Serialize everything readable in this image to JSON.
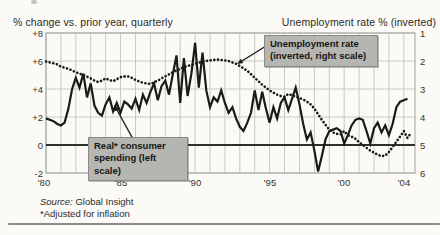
{
  "header": {
    "left_title": "% change vs. prior year, quarterly",
    "right_title": "Unemployment rate % (inverted)"
  },
  "annotations": {
    "unemployment_box": {
      "line1": "Unemployment rate",
      "line2": "(inverted, right scale)"
    },
    "spending_box": {
      "line1": "Real* consumer",
      "line2": "spending (left scale)"
    }
  },
  "footer": {
    "source_label": "Source:",
    "source_value": "Global Insight",
    "footnote": "*Adjusted for inflation"
  },
  "axes": {
    "left_ticks": [
      "+8",
      "+6",
      "+4",
      "+2",
      "0",
      "-2"
    ],
    "right_ticks": [
      "1",
      "2",
      "3",
      "4",
      "5",
      "6"
    ],
    "x_ticks": [
      "'80",
      "'85",
      "'90",
      "'95",
      "'00",
      "'04"
    ]
  },
  "colors": {
    "line": "#1a1a18",
    "grid": "#c9c9c3",
    "frame": "#a2a29c",
    "zero_line": "#2e2e2a",
    "box_bg": "#b5b5b1",
    "background": "#fbfaf7"
  },
  "chart_data": {
    "type": "line",
    "x_axis": {
      "range": [
        1980,
        2004.75
      ],
      "tick_years": [
        1980,
        1985,
        1990,
        1995,
        2000,
        2004
      ],
      "tick_labels": [
        "'80",
        "'85",
        "'90",
        "'95",
        "'00",
        "'04"
      ],
      "grid_step_years": 1
    },
    "left_axis": {
      "label": "% change vs. prior year, quarterly",
      "range": [
        -2,
        8
      ],
      "tick_values": [
        8,
        6,
        4,
        2,
        0,
        -2
      ],
      "zero_line_emphasized": true
    },
    "right_axis": {
      "label": "Unemployment rate % (inverted)",
      "range": [
        1,
        6
      ],
      "inverted": true,
      "tick_values": [
        1,
        2,
        3,
        4,
        5,
        6
      ]
    },
    "grid": true,
    "legend_position": "callout-boxes",
    "series": [
      {
        "name": "Unemployment rate (inverted, right scale)",
        "axis": "right",
        "style": "dotted",
        "x_start": 1980,
        "x_step": 0.25,
        "y": [
          2.02,
          2.05,
          2.08,
          2.12,
          2.2,
          2.24,
          2.28,
          2.34,
          2.4,
          2.45,
          2.5,
          2.56,
          2.62,
          2.7,
          2.75,
          2.7,
          2.62,
          2.68,
          2.72,
          2.65,
          2.58,
          2.55,
          2.55,
          2.6,
          2.68,
          2.73,
          2.78,
          2.8,
          2.82,
          2.76,
          2.7,
          2.62,
          2.55,
          2.48,
          2.4,
          2.34,
          2.28,
          2.22,
          2.18,
          2.14,
          2.1,
          2.06,
          2.02,
          2.0,
          1.98,
          1.96,
          1.95,
          1.96,
          1.98,
          2.0,
          2.05,
          2.1,
          2.18,
          2.26,
          2.35,
          2.47,
          2.6,
          2.72,
          2.85,
          2.95,
          3.05,
          3.13,
          3.2,
          3.25,
          3.28,
          3.18,
          3.22,
          3.28,
          3.32,
          3.38,
          3.45,
          3.55,
          3.7,
          3.9,
          4.1,
          4.28,
          4.45,
          4.55,
          4.6,
          4.62,
          4.5,
          4.65,
          4.7,
          4.78,
          4.9,
          5.0,
          5.1,
          5.2,
          5.28,
          5.35,
          5.4,
          5.38,
          5.25,
          5.08,
          4.88,
          4.7,
          4.5,
          4.75,
          4.55
        ]
      },
      {
        "name": "Real consumer spending (left scale)",
        "axis": "left",
        "style": "solid",
        "x_start": 1980,
        "x_step": 0.25,
        "y": [
          1.9,
          1.8,
          1.7,
          1.5,
          1.4,
          1.6,
          2.6,
          4.0,
          4.8,
          4.1,
          5.1,
          3.4,
          4.4,
          2.8,
          2.3,
          2.1,
          2.9,
          3.4,
          2.4,
          3.0,
          2.3,
          3.1,
          2.9,
          2.6,
          3.3,
          2.5,
          3.6,
          3.0,
          3.8,
          4.4,
          3.2,
          4.2,
          4.6,
          3.6,
          5.0,
          6.4,
          3.0,
          6.2,
          3.5,
          5.1,
          7.3,
          4.1,
          6.6,
          3.9,
          2.7,
          3.4,
          3.1,
          3.9,
          3.0,
          2.3,
          2.7,
          1.9,
          1.3,
          1.0,
          1.6,
          2.3,
          3.9,
          2.5,
          3.8,
          2.6,
          1.6,
          2.7,
          1.9,
          3.0,
          3.4,
          2.5,
          3.3,
          4.1,
          2.9,
          1.5,
          0.4,
          0.9,
          -0.4,
          -1.9,
          -0.8,
          0.4,
          1.0,
          1.1,
          1.2,
          1.0,
          0.1,
          0.7,
          1.4,
          1.8,
          1.9,
          1.8,
          1.0,
          0.1,
          1.2,
          1.6,
          0.9,
          1.4,
          0.7,
          1.5,
          2.7,
          3.1,
          3.2,
          3.3
        ]
      }
    ]
  }
}
